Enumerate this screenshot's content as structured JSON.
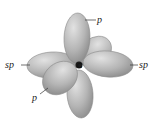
{
  "diagram": {
    "center_label": "C",
    "labels": {
      "p_top": "p",
      "p_bottom": "p",
      "sp_left": "sp",
      "sp_right": "sp"
    },
    "colors": {
      "lobe_fill": "#b8b8b8",
      "lobe_stroke": "#8a8a8a",
      "leader": "#333333",
      "background": "#ffffff"
    }
  }
}
